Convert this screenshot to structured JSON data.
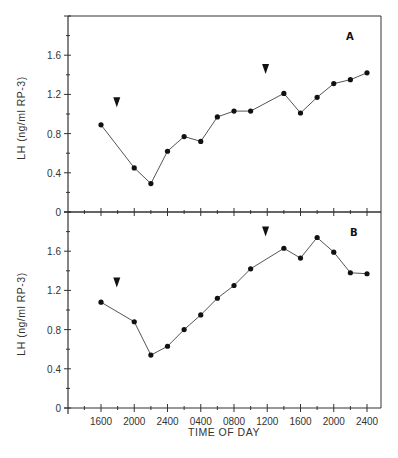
{
  "figure": {
    "xlabel": "TIME OF DAY",
    "ylabel": "LH (ng/ml RP-3)",
    "line_color": "#555555",
    "marker_color": "#111111",
    "axis_color": "#333333"
  },
  "chart_data": [
    {
      "type": "line",
      "panel": "A",
      "title": "",
      "xlabel": "TIME OF DAY",
      "ylabel": "LH (ng/ml RP-3)",
      "ylim": [
        0,
        2.0
      ],
      "yticks": [
        0,
        0.4,
        0.8,
        1.2,
        1.6
      ],
      "ytick_labels": [
        "0",
        "0.4",
        "0.8",
        "1.2",
        "1.6"
      ],
      "xtick_labels": [
        "1600",
        "2000",
        "2400",
        "0400",
        "0800",
        "1200",
        "1600",
        "2000",
        "2400"
      ],
      "grid": false,
      "x": [
        "1600",
        "2000",
        "2200",
        "2400",
        "0200",
        "0400",
        "0600",
        "0800",
        "1000",
        "1400",
        "1600",
        "1800",
        "2000",
        "2200",
        "2400"
      ],
      "x_hours": [
        0,
        4,
        6,
        8,
        10,
        12,
        14,
        16,
        18,
        22,
        24,
        26,
        28,
        30,
        32
      ],
      "values": [
        0.89,
        0.45,
        0.29,
        0.62,
        0.77,
        0.72,
        0.97,
        1.03,
        1.03,
        1.21,
        1.01,
        1.17,
        1.31,
        1.35,
        1.42
      ],
      "annotations": [
        {
          "type": "arrowhead",
          "x_hours": 1.9,
          "y": 1.12
        },
        {
          "type": "arrowhead",
          "x_hours": 19.8,
          "y": 1.46
        }
      ]
    },
    {
      "type": "line",
      "panel": "B",
      "title": "",
      "xlabel": "TIME OF DAY",
      "ylabel": "LH (ng/ml RP-3)",
      "ylim": [
        0,
        2.0
      ],
      "yticks": [
        0,
        0.4,
        0.8,
        1.2,
        1.6
      ],
      "ytick_labels": [
        "0",
        "0.4",
        "0.8",
        "1.2",
        "1.6"
      ],
      "xtick_labels": [
        "1600",
        "2000",
        "2400",
        "0400",
        "0800",
        "1200",
        "1600",
        "2000",
        "2400"
      ],
      "grid": false,
      "x": [
        "1600",
        "2000",
        "2200",
        "2400",
        "0200",
        "0400",
        "0600",
        "0800",
        "1000",
        "1400",
        "1600",
        "1800",
        "2000",
        "2200",
        "2400"
      ],
      "x_hours": [
        0,
        4,
        6,
        8,
        10,
        12,
        14,
        16,
        18,
        22,
        24,
        26,
        28,
        30,
        32
      ],
      "values": [
        1.08,
        0.88,
        0.54,
        0.63,
        0.8,
        0.95,
        1.12,
        1.25,
        1.42,
        1.63,
        1.53,
        1.74,
        1.59,
        1.38,
        1.37
      ],
      "annotations": [
        {
          "type": "arrowhead",
          "x_hours": 1.9,
          "y": 1.28
        },
        {
          "type": "arrowhead",
          "x_hours": 19.8,
          "y": 1.8
        }
      ]
    }
  ]
}
